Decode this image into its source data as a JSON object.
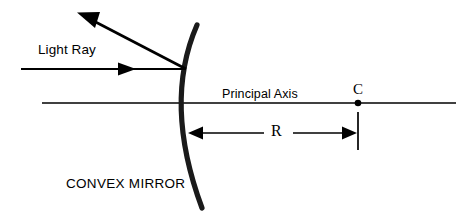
{
  "diagram": {
    "background_color": "#ffffff",
    "stroke_color": "#000000",
    "width": 476,
    "height": 218,
    "labels": {
      "light_ray": "Light Ray",
      "principal_axis": "Principal Axis",
      "convex_mirror": "CONVEX MIRROR",
      "center_of_curvature": "C",
      "radius": "R"
    },
    "geometry": {
      "mirror": {
        "name": "convex-mirror-arc",
        "vertex": [
          181,
          103
        ],
        "top_end": [
          197,
          25
        ],
        "bottom_end": [
          202,
          208
        ],
        "stroke_width": 5,
        "bulge_direction": "left"
      },
      "principal_axis": {
        "name": "principal-axis-line",
        "x_start": 42,
        "x_end": 456,
        "y": 103,
        "stroke_width": 1.2
      },
      "incident_ray": {
        "name": "incident-light-ray",
        "from": [
          21,
          69
        ],
        "to": [
          186,
          69
        ],
        "arrow_at": [
          136,
          69
        ],
        "stroke_width": 2.2
      },
      "reflected_ray": {
        "name": "reflected-light-ray",
        "from": [
          186,
          69
        ],
        "to": [
          78,
          13
        ],
        "stroke_width": 2.6
      },
      "center_point": {
        "name": "center-of-curvature-point",
        "position": [
          358,
          103
        ],
        "radius": 3.2
      },
      "center_tick": {
        "name": "center-vertical-tick",
        "x": 358,
        "y_start": 112,
        "y_end": 150,
        "stroke_width": 1.6
      },
      "radius_dimension": {
        "name": "radius-dimension-arrow",
        "y": 133,
        "left_tip": 189,
        "right_tip": 357,
        "label_gap_start": 264,
        "label_gap_end": 292,
        "stroke_width": 1.6
      }
    }
  }
}
